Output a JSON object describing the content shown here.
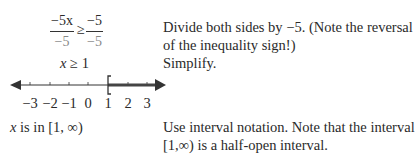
{
  "left": {
    "fraction_left": {
      "numerator": "−5x",
      "denominator": "−5"
    },
    "relation": "≥",
    "fraction_right": {
      "numerator": "−5",
      "denominator": "−5"
    },
    "simplified": {
      "var": "x",
      "rel": "≥",
      "value": "1"
    },
    "number_line": {
      "ticks": [
        "−3",
        "−2",
        "−1",
        "0",
        "1",
        "2",
        "3"
      ],
      "bracket": "[",
      "shaded_from": "1",
      "shaded_direction": "right"
    },
    "interval_statement": {
      "var": "x",
      "text": " is in [1, ∞)"
    }
  },
  "right": {
    "step1_line1": "Divide both sides by −5.  (Note the reversal",
    "step1_line2": "of the inequality sign!)",
    "step2": "Simplify.",
    "step3_line1": "Use interval notation. Note that the interval",
    "step3_line2": "[1,∞)  is a half-open interval."
  },
  "colors": {
    "text": "#2a2a2a",
    "muted": "#888888",
    "line": "#333333",
    "shaded": "#444444"
  }
}
